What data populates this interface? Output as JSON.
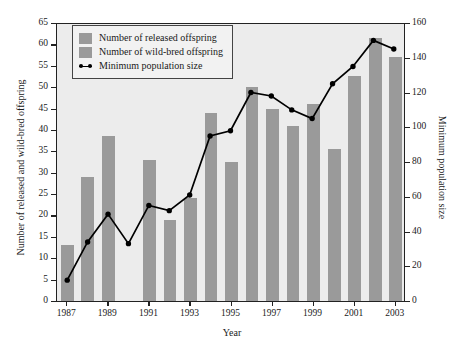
{
  "chart_data": {
    "type": "bar",
    "title": "",
    "xlabel": "Year",
    "ylabel": "Number of released and wild-bred offspring",
    "y2label": "Minimum population size",
    "categories": [
      "1987",
      "1988",
      "1989",
      "1990",
      "1991",
      "1992",
      "1993",
      "1994",
      "1995",
      "1996",
      "1997",
      "1998",
      "1999",
      "2000",
      "2001",
      "2002",
      "2003"
    ],
    "xtick_labels": [
      "1987",
      "1989",
      "1991",
      "1993",
      "1995",
      "1997",
      "1999",
      "2001",
      "2003"
    ],
    "ylim": [
      0,
      65
    ],
    "yticks": [
      0,
      5,
      10,
      15,
      20,
      25,
      30,
      35,
      40,
      45,
      50,
      55,
      60,
      65
    ],
    "y2lim": [
      0,
      160
    ],
    "y2ticks": [
      0,
      20,
      40,
      60,
      80,
      100,
      120,
      140,
      160
    ],
    "grid": false,
    "legend_position": "top-left",
    "series": [
      {
        "name": "Number of released offspring",
        "type": "bar",
        "axis": "left",
        "color": "#9a9a9a",
        "values": [
          13,
          29,
          38.5,
          0,
          33,
          19,
          24,
          44,
          32.5,
          50,
          45,
          41,
          46,
          35.5,
          52.5,
          61.5,
          57
        ]
      },
      {
        "name": "Number of wild-bred offspring",
        "type": "bar",
        "axis": "left",
        "color": "#9a9a9a",
        "values": [
          0,
          0,
          0,
          0,
          0,
          0,
          0,
          0,
          0,
          0,
          0,
          0,
          0,
          0,
          0,
          0,
          0
        ]
      },
      {
        "name": "Minimum population size",
        "type": "line",
        "axis": "right",
        "color": "#000000",
        "values": [
          12,
          34,
          50,
          33,
          55,
          52,
          61,
          95,
          98,
          120,
          118,
          110,
          105,
          125,
          135,
          150,
          145
        ]
      }
    ]
  },
  "legend": {
    "items": [
      {
        "label": "Number of released offspring",
        "symbol": "swatch"
      },
      {
        "label": "Number of wild-bred offspring",
        "symbol": "swatch"
      },
      {
        "label": "Minimum population size",
        "symbol": "line-marker"
      }
    ]
  }
}
